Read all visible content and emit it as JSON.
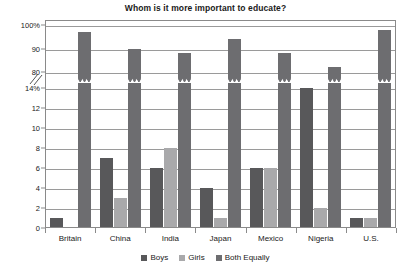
{
  "chart_data": {
    "type": "bar",
    "title": "Whom is it more important to educate?",
    "xlabel": "",
    "ylabel": "",
    "grid": true,
    "legend_position": "bottom",
    "axis_break": true,
    "axis_note": "Y axis is broken: lower segment 0-14%, upper segment 80-100%",
    "ylim_lower": [
      0,
      14
    ],
    "ylim_upper": [
      80,
      100
    ],
    "ytick_labels_lower": [
      "0",
      "2",
      "4",
      "6",
      "8",
      "10",
      "12",
      "14%"
    ],
    "ytick_labels_upper": [
      "80",
      "90",
      "100%"
    ],
    "categories": [
      "Britain",
      "China",
      "India",
      "Japan",
      "Mexico",
      "Nigeria",
      "U.S."
    ],
    "series": [
      {
        "name": "Boys",
        "color": "#58585a",
        "values": [
          1,
          7,
          6,
          4,
          6,
          14,
          1
        ]
      },
      {
        "name": "Girls",
        "color": "#a9a9ab",
        "values": [
          0,
          3,
          8,
          1,
          6,
          2,
          1
        ]
      },
      {
        "name": "Both Equally",
        "color": "#6d6d70",
        "values": [
          97,
          90,
          88,
          94,
          88,
          82,
          98
        ]
      }
    ]
  },
  "legend": {
    "items": [
      {
        "label": "Boys",
        "color": "#58585a"
      },
      {
        "label": "Girls",
        "color": "#a9a9ab"
      },
      {
        "label": "Both Equally",
        "color": "#6d6d70"
      }
    ]
  },
  "colors": {
    "boys": "#58585a",
    "girls": "#a9a9ab",
    "both_equally": "#6d6d70",
    "grid": "#9a9a9a",
    "frame": "#8a8a8a",
    "background": "#ffffff",
    "text": "#1a1a1a"
  }
}
